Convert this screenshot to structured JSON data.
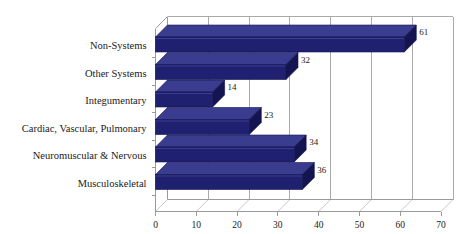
{
  "chart_data": {
    "type": "bar",
    "orientation": "horizontal",
    "style": "3d",
    "title": "",
    "xlabel": "",
    "ylabel": "",
    "categories": [
      "Musculoskeletal",
      "Neuromuscular & Nervous",
      "Cardiac, Vascular, Pulmonary",
      "Integumentary",
      "Other Systems",
      "Non-Systems"
    ],
    "values": [
      36,
      34,
      23,
      14,
      32,
      61
    ],
    "data_labels": [
      "36",
      "34",
      "23",
      "14",
      "32",
      "61"
    ],
    "xlim": [
      0,
      70
    ],
    "xticks": [
      0,
      10,
      20,
      30,
      40,
      50,
      60,
      70
    ],
    "xtick_labels": [
      "0",
      "10",
      "20",
      "30",
      "40",
      "50",
      "60",
      "70"
    ],
    "grid": true,
    "grid_axis": "x",
    "legend": false,
    "legend_position": "none",
    "series": [
      {
        "name": "",
        "values": [
          36,
          34,
          23,
          14,
          32,
          61
        ]
      }
    ]
  },
  "colors": {
    "bar_front": "#1f2070",
    "bar_top": "#3a3c8f",
    "bar_side": "#141550",
    "bar_highlight": "#5557a8",
    "axis": "#9a9a9a",
    "grid": "#aaaaaa",
    "text": "#1a1a1a",
    "background": "#ffffff",
    "floor": "#c9c9c9"
  },
  "plot": {
    "rows_top_to_bottom": [
      {
        "label": "Non-Systems",
        "value": 61,
        "data_label": "61"
      },
      {
        "label": "Other Systems",
        "value": 32,
        "data_label": "32"
      },
      {
        "label": "Integumentary",
        "value": 14,
        "data_label": "14"
      },
      {
        "label": "Cardiac, Vascular, Pulmonary",
        "value": 23,
        "data_label": "23"
      },
      {
        "label": "Neuromuscular & Nervous",
        "value": 34,
        "data_label": "34"
      },
      {
        "label": "Musculoskeletal",
        "value": 36,
        "data_label": "36"
      }
    ]
  }
}
